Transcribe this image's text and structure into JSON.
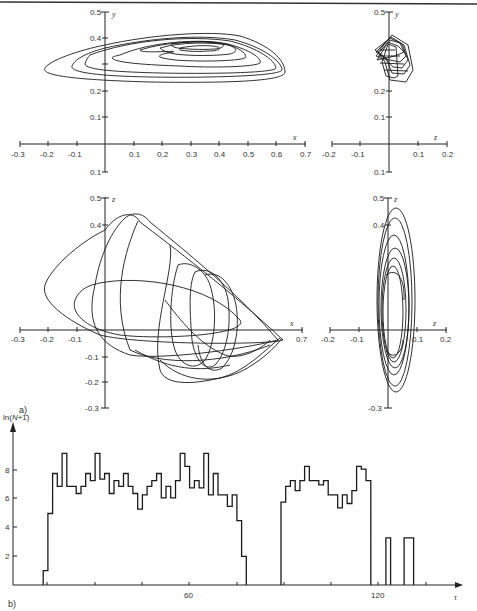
{
  "page": {
    "header_rule": true,
    "panel_a_label": "a)",
    "panel_b_label": "b)"
  },
  "chart_data": [
    {
      "type": "line",
      "title": "",
      "panel": "a) top-left",
      "xlabel": "x",
      "ylabel": "y",
      "xlim": [
        -0.3,
        0.7
      ],
      "ylim": [
        -0.1,
        0.5
      ],
      "xticks": [
        "-0.3",
        "-0.2",
        "-0.1",
        "0.1",
        "0.2",
        "0.3",
        "0.4",
        "0.5",
        "0.6",
        "0.7"
      ],
      "yticks": [
        "0.5",
        "0.4",
        "0.2",
        "0.1",
        "0.1"
      ],
      "description": "Phase trajectory in x-y plane: nested flattened loops spanning x from about -0.2 to 0.63, y from about 0.25 to 0.41"
    },
    {
      "type": "line",
      "title": "",
      "panel": "a) top-right",
      "xlabel": "z",
      "ylabel": "y",
      "xlim": [
        -0.2,
        0.2
      ],
      "ylim": [
        -0.1,
        0.5
      ],
      "xticks": [
        "-0.2",
        "-0.1",
        "0.1",
        "0.2"
      ],
      "yticks": [
        "0.5",
        "0.2",
        "0.1",
        "0.1"
      ],
      "description": "Phase trajectory in z-y plane: compact bundle of loops near z from -0.05 to 0.09, y from 0.26 to 0.42"
    },
    {
      "type": "line",
      "title": "",
      "panel": "a) bottom-left",
      "xlabel": "x",
      "ylabel": "z",
      "xlim": [
        -0.3,
        0.7
      ],
      "ylim": [
        -0.3,
        0.5
      ],
      "xticks": [
        "-0.3",
        "-0.2",
        "-0.1",
        "0.7"
      ],
      "yticks": [
        "0.5",
        "0.4",
        "-0.1",
        "-0.2",
        "-0.3"
      ],
      "description": "Phase trajectory in x-z plane: chaotic folded loops spanning x -0.22 to 0.63, z -0.23 to 0.45"
    },
    {
      "type": "line",
      "title": "",
      "panel": "a) bottom-right",
      "xlabel": "z",
      "ylabel": "z",
      "xlim": [
        -0.2,
        0.2
      ],
      "ylim": [
        -0.3,
        0.5
      ],
      "xticks": [
        "-0.2",
        "-0.1",
        "0.1",
        "0.2"
      ],
      "yticks": [
        "0.5",
        "0.4",
        "-0.3"
      ],
      "description": "Phase trajectory: elongated vertical ellipses near origin, z from -0.05 to 0.09, vertical -0.25 to 0.45"
    },
    {
      "type": "bar",
      "panel": "b)",
      "title": "",
      "xlabel": "τ",
      "ylabel": "ln(N+1)",
      "xticks": [
        "60",
        "120"
      ],
      "yticks": [
        "2",
        "4",
        "6",
        "8"
      ],
      "xlim": [
        0,
        140
      ],
      "ylim": [
        0,
        10
      ],
      "bin_width": 1.5,
      "segments": [
        {
          "start": 13.7,
          "values": [
            1.0,
            5.0,
            7.8,
            6.9,
            9.2,
            6.9,
            6.9,
            6.4,
            6.9,
            7.8,
            7.3,
            9.2,
            7.4,
            7.8,
            6.4,
            7.3,
            6.9,
            7.8,
            6.9,
            6.4,
            5.3,
            6.3,
            6.9,
            7.3,
            7.8,
            6.1,
            6.9,
            6.1,
            7.3,
            9.2,
            8.3,
            6.8,
            7.3,
            6.8,
            9.2,
            6.3,
            7.8,
            6.3,
            6.3,
            5.5,
            6.3,
            4.5,
            2.0
          ]
        },
        {
          "start": 89.2,
          "values": [
            5.8,
            6.9,
            7.3,
            6.6,
            7.3,
            8.3,
            7.3,
            7.3,
            7.0,
            7.3,
            6.3,
            6.3,
            5.4,
            6.3,
            5.7,
            6.6,
            8.3,
            8.1,
            7.3
          ]
        },
        {
          "start": 122.5,
          "values": [
            3.3
          ]
        },
        {
          "start": 128.3,
          "values": [
            3.3,
            3.3
          ]
        }
      ]
    }
  ]
}
